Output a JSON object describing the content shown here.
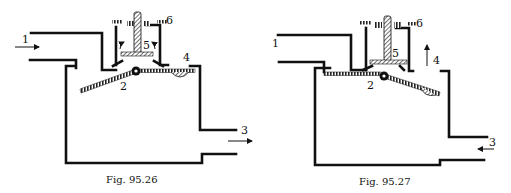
{
  "figures": [
    {
      "id": "fig-95-26",
      "caption": "Fig. 95.26",
      "state": "valve flap open toward outlet; flow from 1 to 3",
      "labels": {
        "inlet": "1",
        "pivot_flap": "2",
        "outlet": "3",
        "port": "4",
        "valve_piston": "5",
        "stop": "6"
      },
      "flow_arrows": {
        "inlet": "right",
        "outlet": "right"
      }
    },
    {
      "id": "fig-95-27",
      "caption": "Fig. 95.27",
      "state": "valve flap open toward port 4; flow from 3 to 4",
      "labels": {
        "inlet": "1",
        "pivot_flap": "2",
        "outlet": "3",
        "port": "4",
        "valve_piston": "5",
        "stop": "6"
      },
      "flow_arrows": {
        "port": "up",
        "outlet": "left"
      }
    }
  ],
  "colors": {
    "line": "#111111",
    "background": "#ffffff",
    "hatch": "#444444"
  }
}
